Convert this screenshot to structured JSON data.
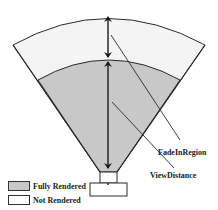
{
  "diagram": {
    "labels": {
      "fade_in_region": "FadeInRegion",
      "view_distance": "ViewDistance"
    },
    "legend": [
      {
        "label": "Fully Rendered",
        "color": "#c8c8c8"
      },
      {
        "label": "Not Rendered",
        "color": "#ffffff"
      }
    ],
    "colors": {
      "fully_rendered": "#c8c8c8",
      "fade_region": "#f4f4f4",
      "stroke": "#2a2a2a"
    }
  }
}
